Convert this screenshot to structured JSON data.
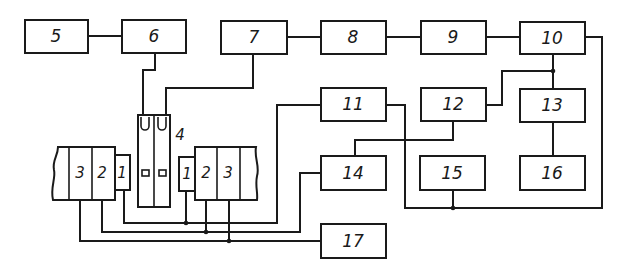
{
  "diagram": {
    "type": "block-diagram",
    "line_color": "#1a1a1a",
    "background": "#ffffff",
    "blocks": [
      {
        "id": "5",
        "label": "5"
      },
      {
        "id": "6",
        "label": "6"
      },
      {
        "id": "7",
        "label": "7"
      },
      {
        "id": "8",
        "label": "8"
      },
      {
        "id": "9",
        "label": "9"
      },
      {
        "id": "10",
        "label": "10"
      },
      {
        "id": "11",
        "label": "11"
      },
      {
        "id": "12",
        "label": "12"
      },
      {
        "id": "13",
        "label": "13"
      },
      {
        "id": "14",
        "label": "14"
      },
      {
        "id": "15",
        "label": "15"
      },
      {
        "id": "16",
        "label": "16"
      },
      {
        "id": "17",
        "label": "17"
      }
    ],
    "device_4": {
      "label": "4"
    },
    "left_assembly": {
      "cells": [
        "3",
        "2",
        "1"
      ]
    },
    "right_assembly": {
      "cells": [
        "1",
        "2",
        "3"
      ]
    },
    "connections": [
      [
        "5",
        "6"
      ],
      [
        "7",
        "8"
      ],
      [
        "8",
        "9"
      ],
      [
        "9",
        "10"
      ],
      [
        "6",
        "4"
      ],
      [
        "7",
        "4"
      ],
      [
        "10",
        "13"
      ],
      [
        "10",
        "12"
      ],
      [
        "13",
        "16"
      ],
      [
        "12",
        "14"
      ],
      [
        "11",
        "15"
      ],
      [
        "10",
        "15"
      ],
      [
        "11",
        "left_assembly.1"
      ],
      [
        "11",
        "right_assembly.1"
      ],
      [
        "14",
        "left_assembly.2"
      ],
      [
        "14",
        "right_assembly.2"
      ],
      [
        "17",
        "left_assembly.3"
      ],
      [
        "17",
        "right_assembly.3"
      ]
    ]
  }
}
